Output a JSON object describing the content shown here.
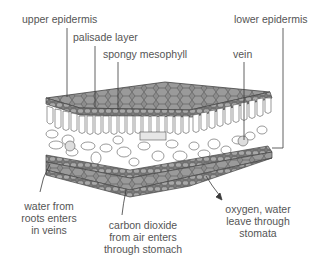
{
  "diagram": {
    "labels": {
      "upper_epidermis": "upper epidermis",
      "palisade_layer": "palisade layer",
      "spongy_mesophyll": "spongy mesophyll",
      "lower_epidermis": "lower epidermis",
      "vein": "vein",
      "water": "water from\nroots enters\nin veins",
      "carbon_dioxide": "carbon dioxide\nfrom air enters\nthrough stomach",
      "oxygen_water": "oxygen, water\nleave through\nstomata"
    },
    "colors": {
      "epidermis": "#8c8c8c",
      "cell_outline": "#4a4a4a",
      "cells": "#ffffff",
      "leader_lines": "#3a3a3a",
      "text": "#555555"
    }
  }
}
